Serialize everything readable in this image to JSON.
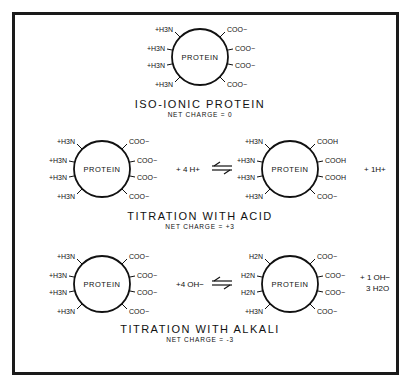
{
  "panels": [
    {
      "id": "iso-ionic",
      "title": "ISO-IONIC PROTEIN",
      "net_charge": "NET CHARGE = 0",
      "protein": {
        "label": "PROTEIN",
        "left_groups": [
          "+H3N",
          "+H3N",
          "+H3N",
          "+H3N"
        ],
        "right_groups": [
          "COO−",
          "COO−",
          "COO−",
          "COO−"
        ]
      }
    },
    {
      "id": "titration-acid",
      "title": "TITRATION WITH ACID",
      "net_charge": "NET CHARGE = +3",
      "reactant": {
        "label": "PROTEIN",
        "left_groups": [
          "+H3N",
          "+H3N",
          "+H3N",
          "+H3N"
        ],
        "right_groups": [
          "COO−",
          "COO−",
          "COO−",
          "COO−"
        ]
      },
      "reagent": "+ 4 H+",
      "arrow": "⇌",
      "product": {
        "label": "PROTEIN",
        "left_groups": [
          "+H3N",
          "+H3N",
          "+H3N",
          "+H3N"
        ],
        "right_groups": [
          "COOH",
          "COOH",
          "COOH",
          "COO−"
        ]
      },
      "byproduct": "+ 1H+"
    },
    {
      "id": "titration-alkali",
      "title": "TITRATION WITH ALKALI",
      "net_charge": "NET CHARGE = -3",
      "reactant": {
        "label": "PROTEIN",
        "left_groups": [
          "+H3N",
          "+H3N",
          "+H3N",
          "+H3N"
        ],
        "right_groups": [
          "COO−",
          "COO−",
          "COO−",
          "COO−"
        ]
      },
      "reagent": "+4 OH−",
      "arrow": "⇌",
      "product": {
        "label": "PROTEIN",
        "left_groups": [
          "H2N",
          "H2N",
          "H2N",
          "+H3N"
        ],
        "right_groups": [
          "COO−",
          "COO−",
          "COO−",
          "COO−"
        ]
      },
      "byproduct_lines": [
        "+ 1 OH−",
        "3 H2O"
      ]
    }
  ]
}
